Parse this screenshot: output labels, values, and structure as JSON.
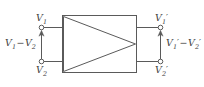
{
  "diagram": {
    "type": "differential-amplifier-block",
    "stroke_color": "#5a5a5a",
    "background_color": "#ffffff",
    "text_color": "#3f3f3f",
    "input_terminals": {
      "top": {
        "base": "V",
        "subscript": "1",
        "prime": "",
        "full": "V1"
      },
      "bottom": {
        "base": "V",
        "subscript": "2",
        "prime": "",
        "full": "V2"
      }
    },
    "output_terminals": {
      "top": {
        "base": "V",
        "subscript": "1",
        "prime": "′",
        "full": "V1'"
      },
      "bottom": {
        "base": "V",
        "subscript": "2",
        "prime": "′",
        "full": "V2'"
      }
    },
    "input_differential": {
      "minuend_base": "V",
      "minuend_sub": "1",
      "minuend_prime": "",
      "operator": "−",
      "subtrahend_base": "V",
      "subtrahend_sub": "2",
      "subtrahend_prime": "",
      "full": "V1 − V2"
    },
    "output_differential": {
      "minuend_base": "V",
      "minuend_sub": "1",
      "minuend_prime": "′",
      "operator": "−",
      "subtrahend_base": "V",
      "subtrahend_sub": "2",
      "subtrahend_prime": "′",
      "full": "V1' − V2'"
    },
    "amplifier_symbol": "triangle-pointing-right",
    "arrows": {
      "input_direction": "up",
      "output_direction": "up"
    }
  }
}
